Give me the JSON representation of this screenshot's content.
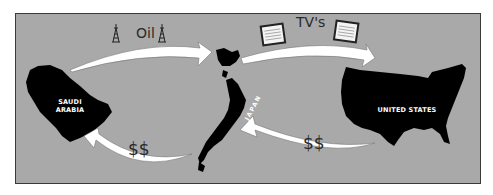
{
  "diagram": {
    "background_color": "#a9a9a9",
    "border_color": "#3a3a3a",
    "arrow_color": "#ffffff",
    "country_color": "#000000",
    "countries": [
      {
        "id": "saudi-arabia",
        "label": "SAUDI ARABIA",
        "label_lines": [
          "SAUDI",
          "ARABIA"
        ]
      },
      {
        "id": "japan",
        "label": "JAPAN"
      },
      {
        "id": "united-states",
        "label": "UNITED STATES"
      }
    ],
    "flows": [
      {
        "from": "saudi-arabia",
        "to": "japan",
        "label": "Oil",
        "icon": "oil-derrick-icon"
      },
      {
        "from": "japan",
        "to": "united-states",
        "label": "TV's",
        "icon": "tv-icon"
      },
      {
        "from": "united-states",
        "to": "japan",
        "label": "$$"
      },
      {
        "from": "japan",
        "to": "saudi-arabia",
        "label": "$$"
      }
    ]
  }
}
